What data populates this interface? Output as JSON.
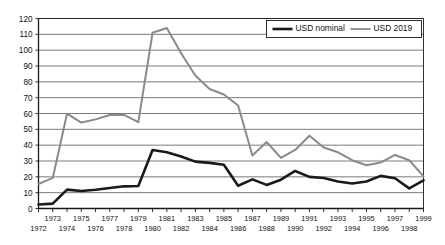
{
  "chart_data": {
    "type": "line",
    "title": "",
    "subtitle": "",
    "xlabel": "",
    "ylabel": "",
    "xlim": [
      1972,
      1999
    ],
    "ylim": [
      0,
      120
    ],
    "y_ticks": [
      0,
      10,
      20,
      30,
      40,
      50,
      60,
      70,
      80,
      90,
      100,
      110,
      120
    ],
    "grid": "horizontal",
    "legend_position": "top-right",
    "x": [
      1972,
      1973,
      1974,
      1975,
      1976,
      1977,
      1978,
      1979,
      1980,
      1981,
      1982,
      1983,
      1984,
      1985,
      1986,
      1987,
      1988,
      1989,
      1990,
      1991,
      1992,
      1993,
      1994,
      1995,
      1996,
      1997,
      1998,
      1999
    ],
    "x_tick_labels_upper": [
      "",
      "1973",
      "",
      "1975",
      "",
      "1977",
      "",
      "1979",
      "",
      "1981",
      "",
      "1983",
      "",
      "1985",
      "",
      "1987",
      "",
      "1989",
      "",
      "1991",
      "",
      "1993",
      "",
      "1995",
      "",
      "1997",
      "",
      "1999"
    ],
    "x_tick_labels_lower": [
      "1972",
      "",
      "1974",
      "",
      "1976",
      "",
      "1978",
      "",
      "1980",
      "",
      "1982",
      "",
      "1984",
      "",
      "1986",
      "",
      "1988",
      "",
      "1990",
      "",
      "1992",
      "",
      "1994",
      "",
      "1996",
      "",
      "1998",
      ""
    ],
    "series": [
      {
        "name": "USD nominal",
        "color": "#1a1a1a",
        "width": 2.6,
        "values": [
          2.5,
          3.1,
          11.9,
          11.1,
          11.8,
          12.9,
          14.0,
          14.2,
          36.9,
          35.5,
          32.9,
          29.6,
          28.8,
          27.6,
          14.4,
          18.4,
          14.9,
          18.2,
          23.7,
          20.0,
          19.3,
          17.0,
          15.8,
          17.0,
          20.6,
          19.1,
          12.7,
          17.8
        ]
      },
      {
        "name": "USD 2019",
        "color": "#8a8a8a",
        "width": 2.0,
        "values": [
          15.5,
          19.3,
          59.9,
          54.3,
          56.3,
          59.0,
          59.1,
          54.5,
          111.0,
          114.0,
          98.0,
          84.0,
          75.5,
          72.0,
          65.0,
          33.5,
          42.0,
          32.0,
          37.0,
          46.0,
          38.5,
          35.5,
          30.5,
          27.3,
          29.0,
          33.8,
          30.5,
          20.3
        ]
      }
    ],
    "legend": [
      {
        "label": "USD nominal",
        "color": "#1a1a1a"
      },
      {
        "label": "USD 2019",
        "color": "#8a8a8a"
      }
    ]
  },
  "axes": {
    "grid_color": "#6b6b6b",
    "frame_color": "#1a1a1a"
  }
}
